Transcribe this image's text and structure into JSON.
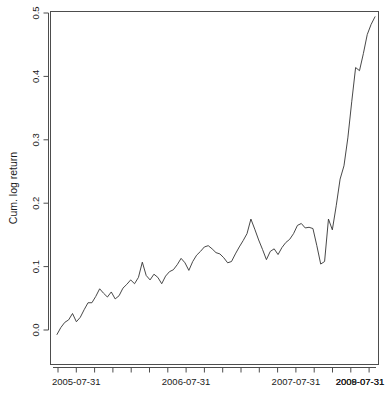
{
  "chart_data": {
    "type": "line",
    "title": "",
    "subtitle": "",
    "xlabel": "",
    "ylabel": "Cum. log return",
    "ylim": [
      -0.035,
      0.515
    ],
    "y_ticks": [
      0.0,
      0.1,
      0.2,
      0.3,
      0.4,
      0.5
    ],
    "y_tick_labels": [
      "0.0",
      "0.1",
      "0.2",
      "0.3",
      "0.4",
      "0.5"
    ],
    "x_tick_labels": [
      "2005-07-31",
      "2006-07-31",
      "2007-07-31",
      "2008-07-31",
      "2009-07-31"
    ],
    "x_minor_tick_count": 18,
    "grid": false,
    "legend": null,
    "line_color": "#333333",
    "series": [
      {
        "name": "Cum. log return",
        "x": [
          0,
          1,
          2,
          3,
          4,
          5,
          6,
          7,
          8,
          9,
          10,
          11,
          12,
          13,
          14,
          15,
          16,
          17,
          18,
          19,
          20,
          21,
          22,
          23,
          24,
          25,
          26,
          27,
          28,
          29,
          30,
          31,
          32,
          33,
          34,
          35,
          36,
          37,
          38,
          39,
          40,
          41,
          42,
          43,
          44,
          45,
          46,
          47,
          48,
          49,
          50,
          51,
          52,
          53,
          54,
          55,
          56,
          57,
          58,
          59,
          60,
          61,
          62,
          63,
          64,
          65,
          66,
          67,
          68,
          69,
          70,
          71,
          72,
          73,
          74,
          75,
          76,
          77,
          78,
          79,
          80,
          81,
          82
        ],
        "values": [
          -0.007,
          0.004,
          0.012,
          0.016,
          0.026,
          0.013,
          0.02,
          0.032,
          0.043,
          0.043,
          0.053,
          0.065,
          0.058,
          0.052,
          0.06,
          0.049,
          0.054,
          0.066,
          0.072,
          0.079,
          0.073,
          0.083,
          0.107,
          0.086,
          0.079,
          0.088,
          0.083,
          0.073,
          0.085,
          0.092,
          0.095,
          0.103,
          0.113,
          0.106,
          0.094,
          0.108,
          0.118,
          0.124,
          0.131,
          0.133,
          0.128,
          0.122,
          0.12,
          0.114,
          0.106,
          0.108,
          0.12,
          0.131,
          0.141,
          0.152,
          0.175,
          0.159,
          0.142,
          0.127,
          0.111,
          0.124,
          0.128,
          0.119,
          0.13,
          0.138,
          0.143,
          0.152,
          0.165,
          0.168,
          0.161,
          0.162,
          0.16,
          0.133,
          0.104,
          0.108,
          0.175,
          0.158,
          0.196,
          0.238,
          0.259,
          0.303,
          0.36,
          0.414,
          0.409,
          0.436,
          0.466,
          0.482,
          0.494
        ]
      }
    ]
  },
  "axis": {
    "y_label": "Cum. log return"
  }
}
